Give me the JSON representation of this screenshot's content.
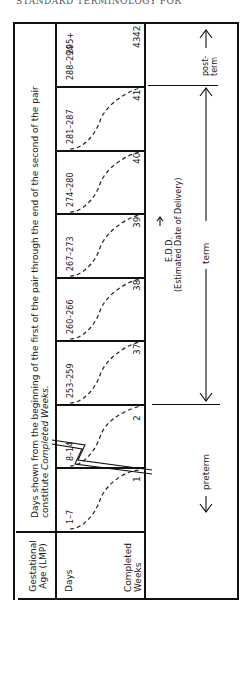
{
  "header": {
    "running_title": "STANDARD TERMINOLOGY FOR"
  },
  "table": {
    "corner_label": "Gestational Age (LMP)",
    "row_labels": {
      "days": "Days",
      "weeks": "Completed Weeks"
    },
    "caption": "Days shown from the beginning of the first of the pair through the end of the second of the pair constitute Completed Weeks.",
    "caption_line1": "Days shown from the beginning of the first of the pair through the end of the second of the pair",
    "caption_line2": "constitute ",
    "caption_italic": "Completed Weeks.",
    "columns": [
      {
        "days": "1–7",
        "week": "1"
      },
      {
        "days": "8–14",
        "week": "2"
      },
      {
        "days": "253–259",
        "week": "37"
      },
      {
        "days": "260–266",
        "week": "38"
      },
      {
        "days": "267–273",
        "week": "39"
      },
      {
        "days": "274–280",
        "week": "40"
      },
      {
        "days": "281–287",
        "week": "41"
      },
      {
        "days": "288–294",
        "week": "42"
      },
      {
        "days": "295+",
        "week": "43"
      }
    ]
  },
  "annotations": {
    "preterm": "preterm",
    "term": "term",
    "postterm_line1": "post-",
    "postterm_line2": "term",
    "edd": "E.D.D.",
    "edd_full": "(Estimated Date of Delivery)"
  }
}
